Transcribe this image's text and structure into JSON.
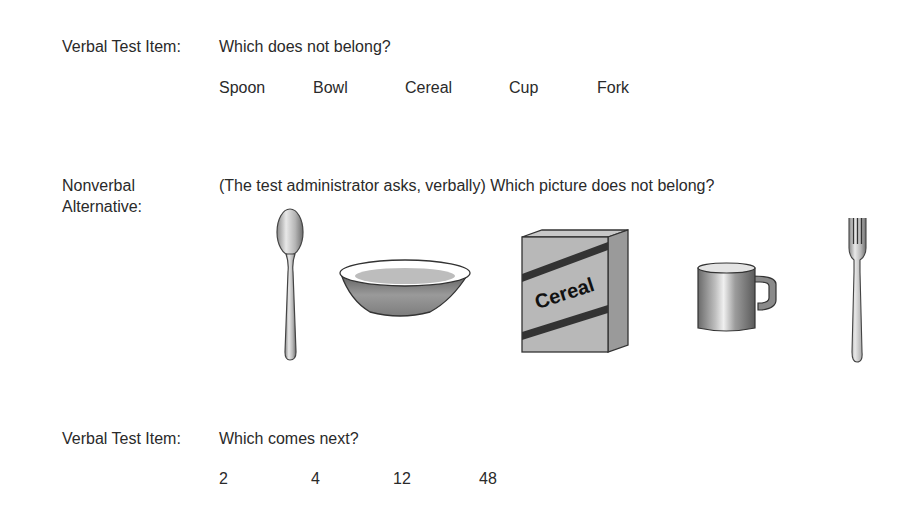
{
  "section1": {
    "label": "Verbal Test Item:",
    "question": "Which does not belong?",
    "words": [
      "Spoon",
      "Bowl",
      "Cereal",
      "Cup",
      "Fork"
    ]
  },
  "section2": {
    "label_line1": "Nonverbal",
    "label_line2": "Alternative:",
    "question": "(The test administrator asks, verbally) Which picture does not belong?",
    "pictures": [
      "spoon",
      "bowl",
      "cereal box",
      "cup",
      "fork"
    ],
    "cereal_box_text": "Cereal"
  },
  "section3": {
    "label": "Verbal Test Item:",
    "question": "Which comes next?",
    "numbers": [
      "2",
      "4",
      "12",
      "48"
    ]
  }
}
